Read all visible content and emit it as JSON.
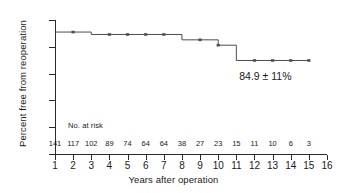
{
  "chart_data": {
    "type": "line",
    "subtype": "kaplan-meier-step",
    "title": "",
    "xlabel": "Years after operation",
    "ylabel": "Percent free from reoperation",
    "xlim": [
      1,
      16
    ],
    "ylim": [
      50,
      100
    ],
    "xticks": [
      1,
      2,
      3,
      4,
      5,
      6,
      7,
      8,
      9,
      10,
      11,
      12,
      13,
      14,
      15,
      16
    ],
    "yticks": [
      50,
      60,
      70,
      80,
      90,
      100
    ],
    "grid": false,
    "legend": null,
    "series": [
      {
        "name": "Freedom from reoperation",
        "x": [
          1,
          3,
          3,
          8,
          8,
          10,
          10,
          11,
          11,
          15
        ],
        "y": [
          95.5,
          95.5,
          94.6,
          94.6,
          92.6,
          92.6,
          90.6,
          90.6,
          84.9,
          84.9
        ],
        "color": "#4d4d4d"
      }
    ],
    "censor_marks": [
      {
        "x": 2,
        "y": 95.5
      },
      {
        "x": 4,
        "y": 94.6
      },
      {
        "x": 5,
        "y": 94.6
      },
      {
        "x": 6,
        "y": 94.6
      },
      {
        "x": 7,
        "y": 94.6
      },
      {
        "x": 9,
        "y": 92.6
      },
      {
        "x": 10,
        "y": 90.6
      },
      {
        "x": 12,
        "y": 84.9
      },
      {
        "x": 13,
        "y": 84.9
      },
      {
        "x": 14,
        "y": 84.9
      },
      {
        "x": 15,
        "y": 84.9
      }
    ],
    "annotations": [
      {
        "text": "84.9 ± 11%",
        "x": 12.6,
        "y": 79.0
      }
    ],
    "risk_table": {
      "label": "No. at risk",
      "x": [
        1,
        2,
        3,
        4,
        5,
        6,
        7,
        8,
        9,
        10,
        11,
        12,
        13,
        14,
        15
      ],
      "values": [
        141,
        117,
        102,
        89,
        74,
        64,
        64,
        38,
        27,
        23,
        15,
        11,
        10,
        6,
        3
      ]
    },
    "colors": {
      "axis": "#2b2b2b",
      "curve": "#4d4d4d",
      "text": "#1a1a1a",
      "background": "#ffffff"
    }
  }
}
